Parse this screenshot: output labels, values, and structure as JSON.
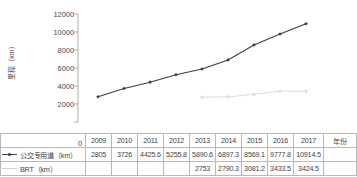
{
  "chart_data": {
    "type": "line",
    "title": "",
    "xlabel": "年份",
    "ylabel": "里程（km）",
    "categories": [
      "2009",
      "2010",
      "2011",
      "2012",
      "2013",
      "2014",
      "2015",
      "2016",
      "2017"
    ],
    "ylim": [
      0,
      12000
    ],
    "y_ticks": [
      "12000",
      "10000",
      "8000",
      "6000",
      "4000",
      "2000",
      "0"
    ],
    "grid": false,
    "legend_position": "bottom-left-table",
    "series": [
      {
        "name": "公交专用道（km）",
        "color": "#3b3b52",
        "marker": "diamond",
        "values": [
          2805,
          3726,
          4425.6,
          5255.8,
          5890.6,
          6897.3,
          8569.1,
          9777.8,
          10914.5
        ],
        "display_values": [
          "2805",
          "3726",
          "4425.6",
          "5255.8",
          "5890.6",
          "6897.3",
          "8569.1",
          "9777.8",
          "10914.5"
        ]
      },
      {
        "name": "BRT（km）",
        "color": "#dcdcdc",
        "marker": "square",
        "values": [
          null,
          null,
          null,
          null,
          2753,
          2790.3,
          3081.2,
          3433.5,
          3424.5
        ],
        "display_values": [
          "",
          "",
          "",
          "",
          "2753",
          "2790.3",
          "3081.2",
          "3433.5",
          "3424.5"
        ]
      }
    ]
  },
  "table": {
    "year_header_label": "年份",
    "zero_label": "0",
    "rows": [
      {
        "label": "",
        "cells": [
          "2009",
          "2010",
          "2011",
          "2012",
          "2013",
          "2014",
          "2015",
          "2016",
          "2017"
        ]
      },
      {
        "label": "公交专用道（km）",
        "cells": [
          "2805",
          "3726",
          "4425.6",
          "5255.8",
          "5890.6",
          "6897.3",
          "8569.1",
          "9777.8",
          "10914.5"
        ]
      },
      {
        "label": "BRT（km）",
        "cells": [
          "",
          "",
          "",
          "",
          "2753",
          "2790.3",
          "3081.2",
          "3433.5",
          "3424.5"
        ]
      }
    ]
  },
  "axis": {
    "y_title": "里程（km）",
    "x_title": "年份",
    "ticks": [
      "12000",
      "10000",
      "8000",
      "6000",
      "4000",
      "2000",
      "0"
    ]
  },
  "colors": {
    "series_1": "#3b3b52",
    "series_2": "#dcdcdc",
    "axis": "#8c8c8c",
    "table_border": "#b9b9b9",
    "text": "#3f3f3f"
  }
}
